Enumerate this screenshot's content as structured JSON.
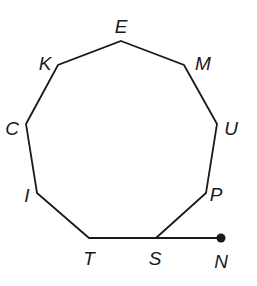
{
  "diagram": {
    "type": "polygon-with-ray",
    "polygon_name": "nonagon",
    "stroke_color": "#1a1a1a",
    "vertices": [
      {
        "id": "E",
        "x": 121,
        "y": 41,
        "lx": 121,
        "ly": 33
      },
      {
        "id": "M",
        "x": 184,
        "y": 65,
        "lx": 203,
        "ly": 70
      },
      {
        "id": "U",
        "x": 217,
        "y": 124,
        "lx": 231,
        "ly": 135
      },
      {
        "id": "P",
        "x": 206,
        "y": 193,
        "lx": 216,
        "ly": 201
      },
      {
        "id": "S",
        "x": 156,
        "y": 238,
        "lx": 155,
        "ly": 265
      },
      {
        "id": "T",
        "x": 89,
        "y": 238,
        "lx": 89,
        "ly": 265
      },
      {
        "id": "I",
        "x": 37,
        "y": 193,
        "lx": 27,
        "ly": 202
      },
      {
        "id": "C",
        "x": 26,
        "y": 124,
        "lx": 12,
        "ly": 135
      },
      {
        "id": "K",
        "x": 58,
        "y": 65,
        "lx": 45,
        "ly": 70
      }
    ],
    "extension": {
      "from": "S",
      "to": {
        "id": "N",
        "x": 221,
        "y": 238,
        "lx": 221,
        "ly": 268
      },
      "endpoint_marker": "filled-dot"
    }
  }
}
